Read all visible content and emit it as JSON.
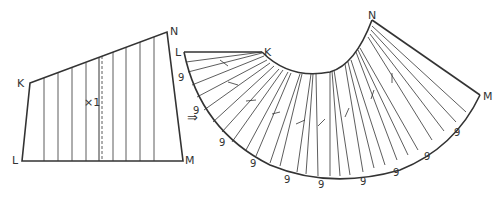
{
  "left_piece": {
    "labels": {
      "K": "K",
      "N": "N",
      "L": "L",
      "M": "M"
    },
    "center_mark": "×1"
  },
  "arrow": "⇒",
  "right_piece": {
    "labels": {
      "K": "K",
      "N": "N",
      "L": "L",
      "M": "M"
    },
    "spread_labels": [
      "9",
      "9",
      "9",
      "9",
      "9",
      "9",
      "9",
      "9",
      "9",
      "9"
    ]
  },
  "colors": {
    "line": "#333333",
    "background": "#ffffff"
  }
}
